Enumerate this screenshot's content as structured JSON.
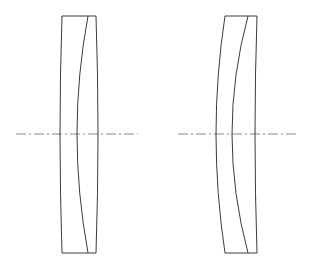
{
  "diagram": {
    "type": "optical-lens-cross-section",
    "background": "#ffffff",
    "line_color": "#3a3a3a",
    "axis_color": "#8a8a8a",
    "optical_axis_y": 134,
    "lenses": [
      {
        "name": "left-lens-doublet",
        "top_y": 16,
        "bottom_y": 253,
        "outer_left": {
          "top_x": 62,
          "mid_x": 60,
          "bottom_x": 62
        },
        "inner_curve": {
          "top_x": 88,
          "mid_x": 77,
          "bottom_x": 88
        },
        "outer_right": {
          "top_x": 96,
          "mid_x": 98,
          "bottom_x": 96
        },
        "axis": {
          "x1": 16,
          "x2": 138
        }
      },
      {
        "name": "right-lens-doublet",
        "top_y": 16,
        "bottom_y": 253,
        "outer_left": {
          "top_x": 225,
          "mid_x": 216,
          "bottom_x": 225
        },
        "inner_curve": {
          "top_x": 248,
          "mid_x": 232,
          "bottom_x": 248
        },
        "outer_right": {
          "top_x": 257,
          "mid_x": 255,
          "bottom_x": 257
        },
        "axis": {
          "x1": 178,
          "x2": 296
        }
      }
    ]
  }
}
